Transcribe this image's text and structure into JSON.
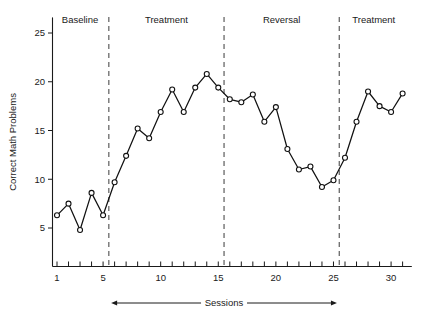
{
  "chart_data": {
    "type": "line",
    "title": "",
    "subtitle": "",
    "xlabel": "Sessions",
    "ylabel": "Correct Math Problems",
    "xlim": [
      0,
      32
    ],
    "ylim": [
      0,
      26.5
    ],
    "grid": false,
    "legend": "none",
    "x": [
      1,
      2,
      3,
      4,
      5,
      6,
      7,
      8,
      9,
      10,
      11,
      12,
      13,
      14,
      15,
      16,
      17,
      18,
      19,
      20,
      21,
      22,
      23,
      24,
      25,
      26,
      27,
      28,
      29,
      30,
      31
    ],
    "values": [
      6.3,
      7.5,
      4.8,
      8.6,
      6.3,
      9.7,
      12.4,
      15.2,
      14.2,
      16.9,
      19.2,
      16.9,
      19.4,
      20.8,
      19.4,
      18.2,
      17.9,
      18.7,
      15.9,
      17.4,
      13.1,
      11.0,
      11.3,
      9.2,
      9.9,
      12.2,
      15.9,
      19.0,
      17.5,
      16.9,
      18.8
    ],
    "series": [
      {
        "name": "Correct Math Problems",
        "marker": "open-circle",
        "color": "#111111",
        "values": [
          6.3,
          7.5,
          4.8,
          8.6,
          6.3,
          9.7,
          12.4,
          15.2,
          14.2,
          16.9,
          19.2,
          16.9,
          19.4,
          20.8,
          19.4,
          18.2,
          17.9,
          18.7,
          15.9,
          17.4,
          13.1,
          11.0,
          11.3,
          9.2,
          9.9,
          12.2,
          15.9,
          19.0,
          17.5,
          16.9,
          18.8
        ]
      }
    ],
    "y_ticks": [
      5,
      10,
      15,
      20,
      25
    ],
    "y_tick_labels": [
      "5",
      "10",
      "15",
      "20",
      "25"
    ],
    "x_ticks": [
      1,
      2,
      3,
      4,
      5,
      6,
      7,
      8,
      9,
      10,
      11,
      12,
      13,
      14,
      15,
      16,
      17,
      18,
      19,
      20,
      21,
      22,
      23,
      24,
      25,
      26,
      27,
      28,
      29,
      30,
      31
    ],
    "x_tick_labels_shown": [
      {
        "value": 1,
        "label": "1"
      },
      {
        "value": 5,
        "label": "5"
      },
      {
        "value": 10,
        "label": "10"
      },
      {
        "value": 15,
        "label": "15"
      },
      {
        "value": 20,
        "label": "20"
      },
      {
        "value": 25,
        "label": "25"
      },
      {
        "value": 30,
        "label": "30"
      }
    ],
    "phases": [
      {
        "label": "Baseline",
        "start": 1,
        "end": 5,
        "center": 3.0
      },
      {
        "label": "Treatment",
        "start": 6,
        "end": 15,
        "center": 10.5
      },
      {
        "label": "Reversal",
        "start": 16,
        "end": 25,
        "center": 20.5
      },
      {
        "label": "Treatment",
        "start": 26,
        "end": 31,
        "center": 28.5
      }
    ],
    "phase_dividers": [
      5.5,
      15.5,
      25.5
    ],
    "colors": {
      "line": "#111111",
      "marker_fill": "#ffffff",
      "axis": "#1a1a1a",
      "divider": "#4d4d4d",
      "background": "#ffffff"
    }
  }
}
